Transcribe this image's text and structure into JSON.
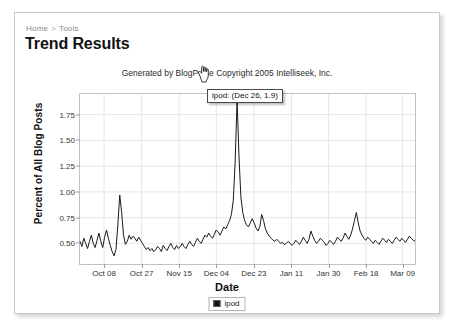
{
  "breadcrumb": {
    "home": "Home",
    "separator": ">",
    "current": "Tools"
  },
  "page": {
    "title": "Trend Results"
  },
  "chart_data": {
    "type": "line",
    "title": "Generated by BlogPulse Copyright 2005 Intelliseek, Inc.",
    "xlabel": "Date",
    "ylabel": "Percent of All Blog Posts",
    "grid": true,
    "legend_position": "bottom-center",
    "ylim": [
      0.3,
      1.95
    ],
    "yticks": [
      0.5,
      0.75,
      1.0,
      1.25,
      1.5,
      1.75
    ],
    "ytick_labels": [
      "0.50",
      "0.75",
      "1.00",
      "1.25",
      "1.50",
      "1.75"
    ],
    "xticks": [
      "Oct 08",
      "Oct 27",
      "Nov 15",
      "Dec 04",
      "Dec 23",
      "Jan 11",
      "Jan 30",
      "Feb 18",
      "Mar 09"
    ],
    "xtick_positions": [
      0.072,
      0.184,
      0.296,
      0.407,
      0.519,
      0.631,
      0.742,
      0.854,
      0.963
    ],
    "series": [
      {
        "name": "ipod",
        "color": "#1a1a1a",
        "values": [
          0.52,
          0.47,
          0.55,
          0.5,
          0.45,
          0.52,
          0.58,
          0.5,
          0.46,
          0.53,
          0.6,
          0.52,
          0.46,
          0.56,
          0.63,
          0.55,
          0.48,
          0.42,
          0.38,
          0.44,
          0.68,
          0.97,
          0.8,
          0.58,
          0.49,
          0.52,
          0.58,
          0.54,
          0.57,
          0.55,
          0.52,
          0.56,
          0.53,
          0.5,
          0.47,
          0.44,
          0.46,
          0.43,
          0.45,
          0.42,
          0.44,
          0.47,
          0.45,
          0.42,
          0.48,
          0.45,
          0.43,
          0.47,
          0.5,
          0.46,
          0.44,
          0.48,
          0.45,
          0.47,
          0.5,
          0.47,
          0.45,
          0.49,
          0.52,
          0.49,
          0.47,
          0.51,
          0.55,
          0.52,
          0.5,
          0.54,
          0.58,
          0.56,
          0.6,
          0.57,
          0.55,
          0.59,
          0.63,
          0.61,
          0.58,
          0.62,
          0.66,
          0.64,
          0.68,
          0.72,
          0.78,
          0.92,
          1.3,
          1.9,
          1.35,
          0.95,
          0.8,
          0.72,
          0.68,
          0.66,
          0.7,
          0.74,
          0.7,
          0.65,
          0.62,
          0.66,
          0.78,
          0.72,
          0.64,
          0.6,
          0.57,
          0.55,
          0.53,
          0.52,
          0.54,
          0.52,
          0.5,
          0.51,
          0.49,
          0.5,
          0.52,
          0.5,
          0.48,
          0.5,
          0.53,
          0.51,
          0.49,
          0.52,
          0.56,
          0.53,
          0.5,
          0.54,
          0.62,
          0.57,
          0.53,
          0.5,
          0.52,
          0.55,
          0.53,
          0.51,
          0.48,
          0.5,
          0.53,
          0.51,
          0.49,
          0.52,
          0.56,
          0.54,
          0.52,
          0.55,
          0.6,
          0.57,
          0.54,
          0.58,
          0.64,
          0.72,
          0.8,
          0.7,
          0.62,
          0.58,
          0.55,
          0.53,
          0.56,
          0.54,
          0.52,
          0.5,
          0.53,
          0.51,
          0.49,
          0.52,
          0.55,
          0.53,
          0.51,
          0.54,
          0.52,
          0.5,
          0.53,
          0.56,
          0.54,
          0.52,
          0.55,
          0.53,
          0.51,
          0.54,
          0.57,
          0.55,
          0.53,
          0.52
        ]
      }
    ],
    "annotations": [
      {
        "label": "ipod: (Dec 26, 1.9)",
        "x": "Dec 26",
        "y": 1.9
      }
    ]
  },
  "legend": {
    "items": [
      {
        "label": "ipod",
        "color": "#111111"
      }
    ]
  },
  "tooltip": {
    "text": "ipod: (Dec 26, 1.9)"
  },
  "cursor": {
    "icon": "pointing-hand-cursor"
  }
}
